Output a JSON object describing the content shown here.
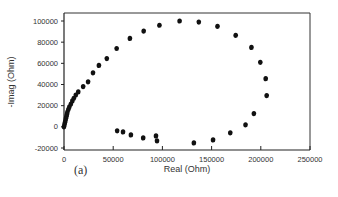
{
  "panel_label": "(a)",
  "chart_data": {
    "type": "scatter",
    "title": "",
    "xlabel": "Real (Ohm)",
    "ylabel": "-Imag (Ohm)",
    "xlim": [
      0,
      250000
    ],
    "ylim": [
      -20000,
      100000
    ],
    "xticks": [
      0,
      50000,
      100000,
      150000,
      200000,
      250000
    ],
    "yticks": [
      -20000,
      0,
      20000,
      40000,
      60000,
      80000,
      100000
    ],
    "grid": false,
    "legend": null,
    "marker_color": "#111111",
    "series": [
      {
        "name": "impedance",
        "points": [
          [
            0,
            0
          ],
          [
            500,
            2000
          ],
          [
            1000,
            4000
          ],
          [
            1500,
            6000
          ],
          [
            2000,
            8000
          ],
          [
            2500,
            10000
          ],
          [
            3000,
            12000
          ],
          [
            3500,
            14000
          ],
          [
            4500,
            16500
          ],
          [
            5500,
            19000
          ],
          [
            7000,
            21500
          ],
          [
            8500,
            24500
          ],
          [
            10000,
            27000
          ],
          [
            12000,
            30000
          ],
          [
            14500,
            33000
          ],
          [
            19500,
            38000
          ],
          [
            24500,
            42500
          ],
          [
            29500,
            51000
          ],
          [
            35500,
            58000
          ],
          [
            43500,
            64500
          ],
          [
            53500,
            74000
          ],
          [
            67000,
            83500
          ],
          [
            81000,
            90500
          ],
          [
            97000,
            96000
          ],
          [
            117500,
            100000
          ],
          [
            137000,
            99000
          ],
          [
            156000,
            95000
          ],
          [
            174500,
            86500
          ],
          [
            190500,
            75000
          ],
          [
            199500,
            61000
          ],
          [
            205000,
            45500
          ],
          [
            206000,
            29500
          ],
          [
            193000,
            12500
          ],
          [
            184500,
            1900
          ],
          [
            169000,
            -5700
          ],
          [
            151500,
            -12400
          ],
          [
            132000,
            -15200
          ],
          [
            94500,
            -13300
          ],
          [
            93500,
            -8600
          ],
          [
            80500,
            -10500
          ],
          [
            68000,
            -7600
          ],
          [
            60000,
            -4800
          ],
          [
            54000,
            -3800
          ]
        ]
      }
    ]
  }
}
